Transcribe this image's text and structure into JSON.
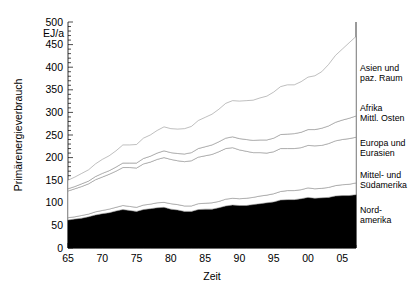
{
  "chart_data": {
    "type": "area",
    "title": "",
    "subtitle": "",
    "xlabel": "Zeit",
    "ylabel": "Primärenergieverbrauch",
    "yunit": "EJ/a",
    "stacked": true,
    "grid": false,
    "legend_position": "right-outside",
    "xlim": [
      1965,
      2007
    ],
    "ylim": [
      0,
      500
    ],
    "yticks": [
      0,
      50,
      100,
      150,
      200,
      250,
      300,
      350,
      400,
      450,
      500
    ],
    "ytick_labels": [
      "0",
      "50",
      "100",
      "150",
      "200",
      "250",
      "300",
      "350",
      "400",
      "450",
      "500"
    ],
    "xticks": [
      1965,
      1970,
      1975,
      1980,
      1985,
      1990,
      1995,
      2000,
      2005
    ],
    "xtick_labels": [
      "65",
      "70",
      "75",
      "80",
      "85",
      "90",
      "95",
      "00",
      "05"
    ],
    "x": [
      1965,
      1966,
      1967,
      1968,
      1969,
      1970,
      1971,
      1972,
      1973,
      1974,
      1975,
      1976,
      1977,
      1978,
      1979,
      1980,
      1981,
      1982,
      1983,
      1984,
      1985,
      1986,
      1987,
      1988,
      1989,
      1990,
      1991,
      1992,
      1993,
      1994,
      1995,
      1996,
      1997,
      1998,
      1999,
      2000,
      2001,
      2002,
      2003,
      2004,
      2005,
      2006,
      2007
    ],
    "series": [
      {
        "name": "Nordamerika",
        "label_line1": "Nord-",
        "label_line2": "amerika",
        "color": "#000000",
        "values": [
          62,
          64,
          66,
          69,
          73,
          76,
          78,
          82,
          85,
          83,
          81,
          85,
          87,
          89,
          90,
          86,
          84,
          81,
          81,
          85,
          86,
          86,
          89,
          93,
          95,
          94,
          94,
          96,
          98,
          100,
          102,
          106,
          107,
          107,
          109,
          112,
          110,
          111,
          112,
          115,
          116,
          116,
          118
        ]
      },
      {
        "name": "Mittel- und Südamerika",
        "label_line1": "Mittel- und",
        "label_line2": "Südamerika",
        "color": "#000000",
        "values": [
          5,
          5,
          6,
          6,
          7,
          7,
          8,
          8,
          9,
          9,
          9,
          10,
          10,
          11,
          11,
          12,
          12,
          12,
          12,
          13,
          13,
          14,
          14,
          15,
          15,
          15,
          16,
          16,
          17,
          17,
          18,
          19,
          20,
          20,
          20,
          21,
          21,
          21,
          22,
          23,
          24,
          25,
          26
        ]
      },
      {
        "name": "Europa und Eurasien",
        "label_line1": "Europa und",
        "label_line2": "Eurasien",
        "color": "#000000",
        "values": [
          59,
          62,
          64,
          67,
          71,
          74,
          77,
          80,
          84,
          86,
          87,
          91,
          93,
          96,
          99,
          98,
          97,
          98,
          100,
          103,
          105,
          107,
          110,
          112,
          112,
          108,
          104,
          99,
          96,
          93,
          93,
          95,
          93,
          93,
          93,
          94,
          95,
          95,
          97,
          99,
          100,
          101,
          101
        ]
      },
      {
        "name": "Afrika und Mittlerer Osten",
        "label_line1": "Afrika",
        "label_line2": "Mittl. Osten",
        "color": "#000000",
        "values": [
          5,
          5,
          6,
          6,
          7,
          8,
          8,
          9,
          10,
          10,
          11,
          12,
          13,
          14,
          15,
          15,
          16,
          17,
          18,
          19,
          20,
          21,
          22,
          23,
          24,
          25,
          26,
          27,
          28,
          29,
          30,
          31,
          32,
          33,
          34,
          35,
          36,
          38,
          39,
          41,
          43,
          45,
          47
        ]
      },
      {
        "name": "Asien und pazifischer Raum",
        "label_line1": "Asien und",
        "label_line2": "paz. Raum",
        "color": "#000000",
        "values": [
          19,
          21,
          23,
          25,
          28,
          31,
          33,
          36,
          40,
          40,
          41,
          45,
          47,
          50,
          53,
          53,
          54,
          56,
          58,
          62,
          65,
          68,
          72,
          77,
          80,
          83,
          86,
          89,
          93,
          97,
          102,
          106,
          109,
          108,
          112,
          116,
          119,
          125,
          136,
          148,
          157,
          167,
          176
        ]
      }
    ],
    "totals": [
      150,
      157,
      165,
      173,
      186,
      196,
      204,
      215,
      228,
      228,
      229,
      243,
      250,
      260,
      268,
      264,
      263,
      264,
      269,
      282,
      289,
      296,
      307,
      320,
      326,
      325,
      326,
      327,
      332,
      336,
      345,
      357,
      361,
      361,
      368,
      378,
      381,
      390,
      406,
      426,
      440,
      454,
      468
    ]
  },
  "axis": {
    "y_unit": "EJ/a",
    "y_title": "Primärenergieverbrauch",
    "x_title": "Zeit"
  }
}
